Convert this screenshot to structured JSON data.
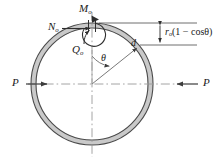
{
  "figure": {
    "background_color": "#ffffff",
    "ring": {
      "fill_color": "#c9c9c9",
      "stroke_color": "#4a4a4a",
      "center_x": 92,
      "center_y": 84,
      "outer_radius": 61,
      "inner_radius": 56
    },
    "line_color": "#4a4a4a",
    "centerline_color": "#9a9a9a",
    "text_color": "#1a1a1a"
  },
  "labels": {
    "moment": {
      "symbol": "M",
      "subscript": "o",
      "text": "Mo"
    },
    "normal_force": {
      "symbol": "N",
      "subscript": "o",
      "text": "No"
    },
    "shear_force": {
      "symbol": "Q",
      "subscript": "o",
      "text": "Qo"
    },
    "angle": {
      "symbol": "θ",
      "text": "θ"
    },
    "radius": {
      "symbol": "d",
      "text": "d"
    },
    "load_left": {
      "symbol": "P",
      "text": "P"
    },
    "load_right": {
      "symbol": "P",
      "text": "P"
    },
    "deflection_formula": {
      "radius_symbol": "r",
      "radius_subscript": "o",
      "expression": "(1 − cosθ)",
      "full_text": "ro(1 − cosθ)"
    }
  },
  "annotations": {
    "loads": [
      {
        "name": "P",
        "side": "left",
        "direction": "right",
        "type": "compressive"
      },
      {
        "name": "P",
        "side": "right",
        "direction": "left",
        "type": "compressive"
      }
    ],
    "internal_forces": [
      "Mo",
      "No",
      "Qo"
    ],
    "dimension": "ro(1 − cosθ)",
    "angle_measured_from": "vertical-axis"
  }
}
